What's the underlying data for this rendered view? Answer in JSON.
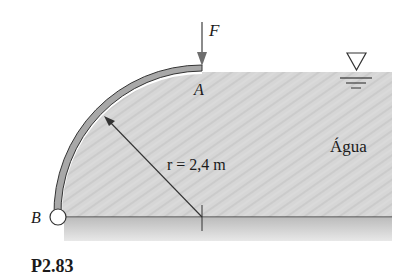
{
  "figure": {
    "caption": "P2.83",
    "labels": {
      "force": "F",
      "point_a": "A",
      "point_b": "B",
      "radius": "r = 2,4 m",
      "fluid": "Água"
    },
    "colors": {
      "water": "#d4d4d4",
      "gate_fill": "#a8a8a8",
      "line": "#333333",
      "force_arrow": "#6e6e6e"
    },
    "geometry": {
      "center": [
        202,
        217
      ],
      "radius_px": 144,
      "water_surface_y": 72,
      "water_right_x": 392,
      "floor_y": 217,
      "floor_bottom_y": 240
    }
  }
}
